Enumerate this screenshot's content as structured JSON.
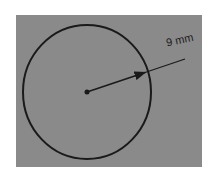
{
  "diagram": {
    "type": "circle-radius",
    "background_color": "#8a8a8a",
    "stroke_color": "#1a1a1a",
    "radius_label": "9 mm",
    "shapes": {
      "circle": {
        "cx": 87,
        "cy": 92,
        "rx": 64,
        "ry": 67
      },
      "center_point": {
        "cx": 87,
        "cy": 92,
        "r": 2.5
      },
      "radius_line": {
        "x1": 87,
        "y1": 92,
        "x2": 185,
        "y2": 59
      }
    }
  }
}
